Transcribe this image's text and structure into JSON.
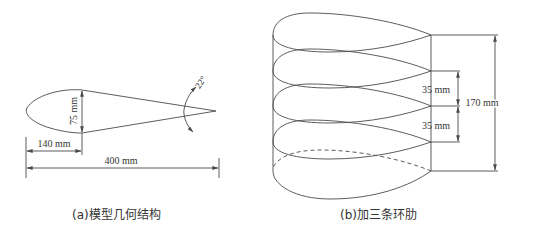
{
  "panel_a": {
    "caption": "(a)模型几何结构",
    "dimensions": {
      "thickness": "75 mm",
      "max_thickness_position": "140 mm",
      "chord": "400 mm",
      "trailing_edge_angle": "22°"
    }
  },
  "panel_b": {
    "caption": "(b)加三条环肋",
    "dimensions": {
      "rib_spacing_1": "35 mm",
      "rib_spacing_2": "35 mm",
      "total_height": "170 mm"
    },
    "rib_count": 3
  },
  "colors": {
    "line": "#4a4a4a",
    "text": "#333333",
    "background": "#ffffff"
  }
}
